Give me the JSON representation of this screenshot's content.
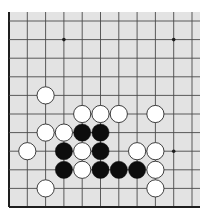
{
  "board": {
    "background": "#e3e3e3",
    "line_color": "#4a4a4a",
    "edge_color": "#1e1e1e",
    "area": {
      "left": 9,
      "top": 12,
      "right": 200,
      "bottom": 207
    },
    "columns_x": [
      9,
      27.3,
      45.6,
      63.9,
      82.2,
      100.5,
      118.8,
      137.1,
      155.4,
      173.7,
      192
    ],
    "rows_y": [
      21,
      39.6,
      58.2,
      76.8,
      95.4,
      114,
      132.6,
      151.2,
      169.8,
      188.4,
      207
    ],
    "edges": {
      "left": true,
      "bottom": true,
      "top": false,
      "right": false
    },
    "star_points": [
      {
        "col": 3,
        "row": 1
      },
      {
        "col": 9,
        "row": 1
      },
      {
        "col": 9,
        "row": 7
      }
    ],
    "stone_radius": 8.6,
    "colors": {
      "black": "#0d0d0d",
      "white": "#ffffff",
      "white_outline": "#2a2a2a"
    }
  },
  "stones": [
    {
      "color": "white",
      "col": 2,
      "row": 4
    },
    {
      "color": "white",
      "col": 4,
      "row": 5
    },
    {
      "color": "white",
      "col": 5,
      "row": 5
    },
    {
      "color": "white",
      "col": 6,
      "row": 5
    },
    {
      "color": "white",
      "col": 8,
      "row": 5
    },
    {
      "color": "white",
      "col": 2,
      "row": 6
    },
    {
      "color": "white",
      "col": 3,
      "row": 6
    },
    {
      "color": "black",
      "col": 4,
      "row": 6
    },
    {
      "color": "black",
      "col": 5,
      "row": 6
    },
    {
      "color": "white",
      "col": 1,
      "row": 7
    },
    {
      "color": "black",
      "col": 3,
      "row": 7
    },
    {
      "color": "white",
      "col": 4,
      "row": 7
    },
    {
      "color": "black",
      "col": 5,
      "row": 7
    },
    {
      "color": "white",
      "col": 7,
      "row": 7
    },
    {
      "color": "white",
      "col": 8,
      "row": 7
    },
    {
      "color": "black",
      "col": 3,
      "row": 8
    },
    {
      "color": "white",
      "col": 4,
      "row": 8
    },
    {
      "color": "black",
      "col": 5,
      "row": 8
    },
    {
      "color": "black",
      "col": 6,
      "row": 8
    },
    {
      "color": "black",
      "col": 7,
      "row": 8
    },
    {
      "color": "white",
      "col": 8,
      "row": 8
    },
    {
      "color": "white",
      "col": 2,
      "row": 9
    },
    {
      "color": "white",
      "col": 8,
      "row": 9
    }
  ]
}
